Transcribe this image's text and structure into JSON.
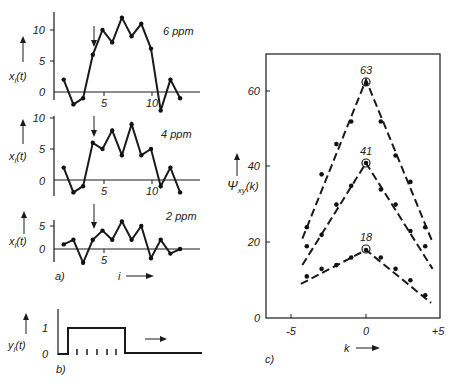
{
  "chart_data": [
    {
      "id": "a-6ppm",
      "type": "line",
      "panel": "a)",
      "annotation": "6 ppm",
      "ylabel": "x_i(t)",
      "xlabel": "i",
      "x": [
        1,
        2,
        3,
        4,
        5,
        6,
        7,
        8,
        9,
        10,
        11,
        12,
        13
      ],
      "values": [
        2,
        -2,
        -1,
        6,
        10,
        8,
        12,
        9,
        11,
        7,
        -3,
        2,
        -1
      ],
      "xticks": [
        "5",
        "10"
      ],
      "yticks": [
        "0",
        "5",
        "10"
      ],
      "marker_arrow_at": 4
    },
    {
      "id": "a-4ppm",
      "type": "line",
      "panel": "a)",
      "annotation": "4 ppm",
      "ylabel": "x_i(t)",
      "xlabel": "i",
      "x": [
        1,
        2,
        3,
        4,
        5,
        6,
        7,
        8,
        9,
        10,
        11,
        12,
        13
      ],
      "values": [
        2,
        -2,
        -1,
        6,
        5,
        8,
        4,
        9,
        4,
        5,
        -1,
        2,
        -2
      ],
      "xticks": [
        "5",
        "10"
      ],
      "yticks": [
        "0",
        "5",
        "10"
      ],
      "marker_arrow_at": 4
    },
    {
      "id": "a-2ppm",
      "type": "line",
      "panel": "a)",
      "annotation": "2 ppm",
      "ylabel": "x_i(t)",
      "xlabel": "i",
      "x": [
        1,
        2,
        3,
        4,
        5,
        6,
        7,
        8,
        9,
        10,
        11,
        12,
        13
      ],
      "values": [
        1,
        2,
        -3,
        2,
        4,
        2,
        6,
        2,
        5,
        -2,
        2,
        -1,
        0
      ],
      "xticks": [
        "5"
      ],
      "yticks": [
        "0",
        "5"
      ],
      "marker_arrow_at": 4
    },
    {
      "id": "b-input",
      "type": "line",
      "panel": "b)",
      "ylabel": "y_i(t)",
      "yticks": [
        "0",
        "1"
      ],
      "description": "rectangular pulse from 0 to 1 with five tick marks under the pulse",
      "pulse": {
        "low": 0,
        "high": 1,
        "ticks": 5
      }
    },
    {
      "id": "c-correlation",
      "type": "line",
      "panel": "c)",
      "ylabel": "Ψxy(k)",
      "xlabel": "k",
      "xticks": [
        "-5",
        "0",
        "+5"
      ],
      "yticks": [
        "0",
        "20",
        "40",
        "60"
      ],
      "ylim": [
        0,
        70
      ],
      "xlim": [
        -6,
        5.2
      ],
      "series": [
        {
          "name": "6 ppm",
          "peak_label": "63",
          "peak": 63,
          "x": [
            -4,
            -3,
            -2,
            -1,
            0,
            1,
            2,
            3,
            4
          ],
          "values": [
            24,
            38,
            46,
            52,
            62,
            52,
            43,
            36,
            24
          ]
        },
        {
          "name": "4 ppm",
          "peak_label": "41",
          "peak": 41,
          "x": [
            -4,
            -3,
            -2,
            -1,
            0,
            1,
            2,
            3,
            4
          ],
          "values": [
            19,
            22,
            30,
            35,
            41,
            34,
            30,
            23,
            19
          ]
        },
        {
          "name": "2 ppm",
          "peak_label": "18",
          "peak": 18,
          "x": [
            -4,
            -3,
            -2,
            -1,
            0,
            1,
            2,
            3,
            4
          ],
          "values": [
            11,
            13,
            14,
            16,
            18,
            16,
            13,
            10,
            6
          ]
        }
      ]
    }
  ],
  "labels": {
    "panel_a": "a)",
    "panel_b": "b)",
    "panel_c": "c)",
    "xi_label": "x",
    "xi_sub": "i",
    "t_paren": "(t)",
    "yi_label": "y",
    "yi_sub": "i",
    "i_axis": "i",
    "k_axis": "k",
    "psi": "Ψ",
    "psi_sub": "xy",
    "psi_arg": "(k)",
    "ppm6": "6 ppm",
    "ppm4": "4 ppm",
    "ppm2": "2 ppm",
    "t0": "0",
    "t5": "5",
    "t10": "10",
    "t1": "1",
    "c0": "0",
    "c20": "20",
    "c40": "40",
    "c60": "60",
    "km5": "-5",
    "k0": "0",
    "kp5": "+5",
    "p63": "63",
    "p41": "41",
    "p18": "18"
  }
}
